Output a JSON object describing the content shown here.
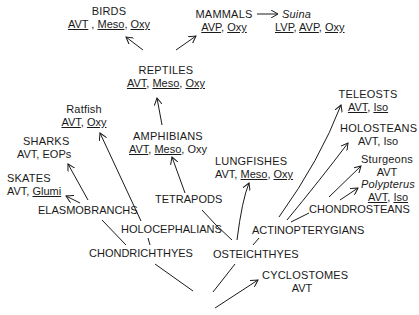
{
  "nodes": {
    "birds": {
      "name": "BIRDS",
      "traits": [
        "AVT",
        "Meso",
        "Oxy"
      ]
    },
    "mammals": {
      "name": "MAMMALS",
      "traits": [
        "AVP",
        "Oxy"
      ]
    },
    "suina": {
      "name": "Suina",
      "traits": [
        "LVP",
        "AVP",
        "Oxy"
      ]
    },
    "reptiles": {
      "name": "REPTILES",
      "traits": [
        "AVT",
        "Meso",
        "Oxy"
      ]
    },
    "ratfish": {
      "name": "Ratfish",
      "traits": [
        "AVT",
        "Oxy"
      ]
    },
    "sharks": {
      "name": "SHARKS",
      "traits": [
        "AVT",
        "EOPs"
      ]
    },
    "skates": {
      "name": "SKATES",
      "traits": [
        "AVT",
        "Glumi"
      ]
    },
    "amphibians": {
      "name": "AMPHIBIANS",
      "traits": [
        "AVT",
        "Meso",
        "Oxy"
      ]
    },
    "lungfishes": {
      "name": "LUNGFISHES",
      "traits": [
        "AVT",
        "Meso",
        "Oxy"
      ]
    },
    "teleosts": {
      "name": "TELEOSTS",
      "traits": [
        "AVT",
        "Iso"
      ]
    },
    "holosteans": {
      "name": "HOLOSTEANS",
      "traits": [
        "AVT",
        "Iso"
      ]
    },
    "sturgeons": {
      "name": "Sturgeons",
      "traits": [
        "AVT"
      ]
    },
    "polypterus": {
      "name": "Polypterus",
      "traits": [
        "AVT",
        "Iso"
      ]
    },
    "elasmobranchs": {
      "name": "ELASMOBRANCHS"
    },
    "holocephalians": {
      "name": "HOLOCEPHALIANS"
    },
    "tetrapods": {
      "name": "TETRAPODS"
    },
    "chondrosteans": {
      "name": "CHONDROSTEANS"
    },
    "actinopterygians": {
      "name": "ACTINOPTERYGIANS"
    },
    "chondrichthyes": {
      "name": "CHONDRICHTHYES"
    },
    "osteichthyes": {
      "name": "OSTEICHTHYES"
    },
    "cyclostomes": {
      "name": "CYCLOSTOMES",
      "traits": [
        "AVT"
      ]
    }
  },
  "separators": {
    "comma": ", "
  }
}
